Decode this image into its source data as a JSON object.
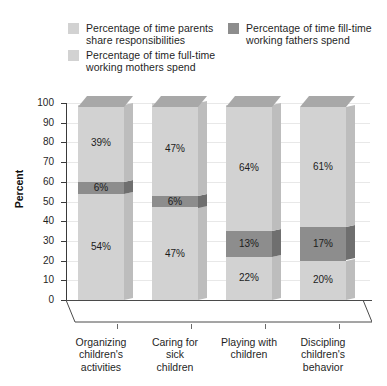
{
  "legend": {
    "entries": [
      {
        "id": "shared",
        "label": "Percentage of time parents\nshare responsibilities",
        "color": "#d2d2d2"
      },
      {
        "id": "fathers",
        "label": "Percentage of time fill-time\nworking fathers spend",
        "color": "#8d8d8d"
      },
      {
        "id": "mothers",
        "label": "Percentage of time full-time\nworking mothers spend",
        "color": "#d2d2d2"
      }
    ]
  },
  "axes": {
    "ylabel": "Percent",
    "yticks": [
      "100",
      "90",
      "80",
      "70",
      "60",
      "50",
      "40",
      "30",
      "20",
      "10",
      "0"
    ]
  },
  "chart_data": {
    "type": "bar",
    "title": "",
    "xlabel": "",
    "ylabel": "Percent",
    "ylim": [
      0,
      100
    ],
    "grid": true,
    "stacked": true,
    "legend_position": "top",
    "categories": [
      "Organizing\nchildren's\nactivities",
      "Caring for\nsick\nchildren",
      "Playing with\nchildren",
      "Discipling\nchildren's\nbehavior"
    ],
    "series": [
      {
        "name": "Percentage of time full-time working mothers spend",
        "color": "#d2d2d2",
        "values": [
          54,
          47,
          22,
          20
        ],
        "labels": [
          "54%",
          "47%",
          "22%",
          "20%"
        ]
      },
      {
        "name": "Percentage of time fill-time working fathers spend",
        "color": "#8d8d8d",
        "values": [
          6,
          6,
          13,
          17
        ],
        "labels": [
          "6%",
          "6%",
          "13%",
          "17%"
        ]
      },
      {
        "name": "Percentage of time parents share responsibilities",
        "color": "#d2d2d2",
        "values": [
          39,
          47,
          64,
          61
        ],
        "labels": [
          "39%",
          "47%",
          "64%",
          "61%"
        ]
      }
    ]
  }
}
